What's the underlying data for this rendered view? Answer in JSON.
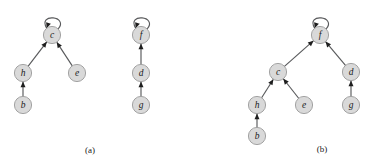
{
  "figure": {
    "background_color": "#ffffff",
    "node_fill_color": "#d9d9d9",
    "node_stroke_color": "#9a9a9a",
    "edge_color": "#58595b",
    "arrow_color": "#1e1e1e",
    "label_color": "#1a1a1a",
    "node_radius": 8.6
  },
  "panels": [
    {
      "id": "panel-a",
      "caption": "(a)",
      "caption_x": 90,
      "caption_y": 150,
      "nodes": [
        {
          "id": "a-c",
          "label": "c",
          "x": 52,
          "y": 35
        },
        {
          "id": "a-h",
          "label": "h",
          "x": 23,
          "y": 73
        },
        {
          "id": "a-e",
          "label": "e",
          "x": 77,
          "y": 73
        },
        {
          "id": "a-b",
          "label": "b",
          "x": 23,
          "y": 105
        },
        {
          "id": "a-f",
          "label": "f",
          "x": 141,
          "y": 35
        },
        {
          "id": "a-d",
          "label": "d",
          "x": 141,
          "y": 73
        },
        {
          "id": "a-g",
          "label": "g",
          "x": 141,
          "y": 105
        }
      ],
      "edges": [
        {
          "from": "a-h",
          "to": "a-c"
        },
        {
          "from": "a-e",
          "to": "a-c"
        },
        {
          "from": "a-b",
          "to": "a-h"
        },
        {
          "from": "a-d",
          "to": "a-f"
        },
        {
          "from": "a-g",
          "to": "a-d"
        }
      ],
      "self_loops": [
        {
          "node": "a-c"
        },
        {
          "node": "a-f"
        }
      ]
    },
    {
      "id": "panel-b",
      "caption": "(b)",
      "caption_x": 322,
      "caption_y": 149,
      "nodes": [
        {
          "id": "b-f",
          "label": "f",
          "x": 320,
          "y": 35
        },
        {
          "id": "b-c",
          "label": "c",
          "x": 278,
          "y": 72
        },
        {
          "id": "b-d",
          "label": "d",
          "x": 351,
          "y": 72
        },
        {
          "id": "b-h",
          "label": "h",
          "x": 257,
          "y": 105
        },
        {
          "id": "b-e",
          "label": "e",
          "x": 304,
          "y": 105
        },
        {
          "id": "b-g",
          "label": "g",
          "x": 351,
          "y": 105
        },
        {
          "id": "b-b",
          "label": "b",
          "x": 257,
          "y": 136
        }
      ],
      "edges": [
        {
          "from": "b-c",
          "to": "b-f"
        },
        {
          "from": "b-d",
          "to": "b-f"
        },
        {
          "from": "b-h",
          "to": "b-c"
        },
        {
          "from": "b-e",
          "to": "b-c"
        },
        {
          "from": "b-g",
          "to": "b-d"
        },
        {
          "from": "b-b",
          "to": "b-h"
        }
      ],
      "self_loops": [
        {
          "node": "b-f"
        }
      ]
    }
  ]
}
